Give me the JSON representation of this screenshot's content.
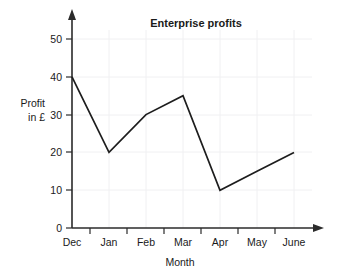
{
  "chart_data": {
    "type": "line",
    "title": "Enterprise profits",
    "xlabel": "Month",
    "ylabel": "Profit in £",
    "ylabel_line1": "Profit",
    "ylabel_line2": "in £",
    "categories": [
      "Dec",
      "Jan",
      "Feb",
      "Mar",
      "Apr",
      "May",
      "June"
    ],
    "values": [
      40,
      20,
      30,
      35,
      10,
      15,
      20
    ],
    "series": [
      {
        "name": "Profit",
        "values": [
          40,
          20,
          30,
          35,
          10,
          15,
          20
        ]
      }
    ],
    "ylim": [
      0,
      55
    ],
    "xlim": [
      0,
      7
    ],
    "y_ticks": [
      0,
      10,
      20,
      30,
      40,
      50
    ],
    "y_tick_labels": [
      "0",
      "10",
      "20",
      "30",
      "40",
      "50"
    ],
    "x_tick_labels": [
      "Dec",
      "Jan",
      "Feb",
      "Mar",
      "Apr",
      "May",
      "June"
    ],
    "grid": true,
    "grid_color": "#f0f0f2",
    "legend": false,
    "legend_position": "none",
    "line_color": "#1d1d1d",
    "axis_color": "#2b2b2b",
    "background_color": "#ffffff",
    "y_axis_arrow": true,
    "x_axis_arrow": true,
    "annotations": []
  }
}
